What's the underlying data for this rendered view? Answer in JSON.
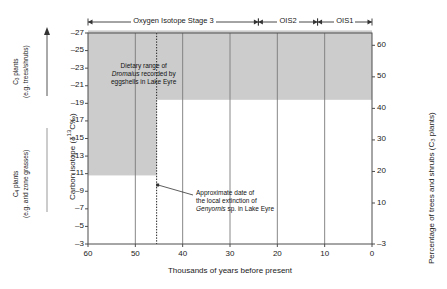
{
  "chart_data": {
    "type": "area",
    "title": "",
    "xlabel": "Thousands of years before present",
    "ylabel_left": "Carbon isotope (δ13C‰)",
    "ylabel_right": "Percentage of trees and shrubs (C3 plants)",
    "xlim": [
      60,
      0
    ],
    "x_reversed": true,
    "xticks": [
      60,
      50,
      40,
      30,
      20,
      10,
      0
    ],
    "xticklabels": [
      "60",
      "50",
      "40",
      "30",
      "20",
      "10",
      "0"
    ],
    "ylim_left": [
      -27,
      -3
    ],
    "yticks_left": [
      -27,
      -25,
      -23,
      -21,
      -19,
      -17,
      -15,
      -13,
      -11,
      -9,
      -7,
      -5,
      -3
    ],
    "yticklabels_left": [
      "–27",
      "–25",
      "–23",
      "–21",
      "–19",
      "–17",
      "–15",
      "–13",
      "–11",
      "–9",
      "–7",
      "–5",
      "–3"
    ],
    "yticks_right": [
      60,
      50,
      40,
      30,
      20,
      10,
      -3
    ],
    "yticklabels_right": [
      "60",
      "50",
      "40",
      "30",
      "20",
      "10",
      "–3"
    ],
    "grid": true,
    "grid_axis": "x",
    "legend": "none",
    "series": [
      {
        "name": "Dietary range of Dromaius (before extinction event)",
        "type": "band",
        "x_start": 60,
        "x_end": 45.5,
        "y_top": -27.3,
        "y_bottom": -10.8,
        "fill": "#cccccc"
      },
      {
        "name": "Dietary range of Dromaius (after extinction event)",
        "type": "band",
        "x_start": 45.5,
        "x_end": 0,
        "y_top": -27.3,
        "y_bottom": -19.4,
        "fill": "#cccccc"
      }
    ],
    "vlines": [
      {
        "name": "Genyornis extinction date",
        "x": 45.5,
        "style": "dotted",
        "color": "#222222"
      }
    ],
    "annotations": [
      {
        "name": "dromaius-dietary-range-note",
        "text_lines": [
          "Dietary range of",
          "Dromaius recorded by",
          "eggshells in Lake Eyre"
        ],
        "italic_line_index": 1,
        "italic_word": "Dromaius"
      },
      {
        "name": "genyornis-extinction-note",
        "text_lines": [
          "Approximate date of",
          "the local extinction of",
          "Genyornis sp. in Lake Eyre"
        ],
        "italic_word": "Genyornis"
      }
    ]
  },
  "top_axis": {
    "name": "oxygen-isotope-stage-bar",
    "stages": [
      {
        "label": "Oxygen Isotope Stage 3",
        "x_start": 60,
        "x_end": 24
      },
      {
        "label": "OIS2",
        "x_start": 24,
        "x_end": 11.5
      },
      {
        "label": "OIS1",
        "x_start": 11.5,
        "x_end": 0
      }
    ]
  },
  "left_guides": {
    "c3": {
      "line1": "C",
      "sub1": "3",
      "line1b": " plants",
      "line2": "(e.g. trees/shrubs)",
      "arrow": "up"
    },
    "c4": {
      "line1": "C",
      "sub1": "4",
      "line1b": " plants",
      "line2": "(e.g. arid zone grasses)",
      "arrow": "none"
    }
  },
  "axis_titles": {
    "x": "Thousands of years before present",
    "y_left_prefix": "Carbon isotope (",
    "y_left_delta": "δ",
    "y_left_mid": "13",
    "y_left_suffix": "C‰)",
    "y_right_prefix": "Percentage of trees and shrubs (C",
    "y_right_sub": "3",
    "y_right_suffix": " plants)"
  },
  "annotations_text": {
    "dromaius_l1": "Dietary range of",
    "dromaius_l2a": "Dromaius",
    "dromaius_l2b": " recorded by",
    "dromaius_l3": "eggshells in Lake Eyre",
    "genyornis_l1": "Approximate date of",
    "genyornis_l2": "the local extinction of",
    "genyornis_l3a": "Genyornis",
    "genyornis_l3b": " sp. in Lake Eyre"
  },
  "colors": {
    "band_fill": "#cccccc",
    "frame": "#4d4d4d",
    "grid": "#7a7a7a",
    "text": "#1a1a1a"
  }
}
